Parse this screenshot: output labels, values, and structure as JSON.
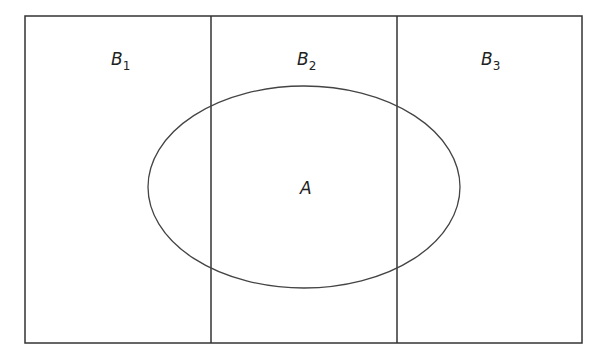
{
  "diagram": {
    "type": "venn-partition",
    "colors": {
      "stroke": "#333333",
      "background": "#ffffff",
      "text": "#222222"
    },
    "partitions": [
      {
        "id": "B1",
        "base": "B",
        "sub": "1"
      },
      {
        "id": "B2",
        "base": "B",
        "sub": "2"
      },
      {
        "id": "B3",
        "base": "B",
        "sub": "3"
      }
    ],
    "event": {
      "id": "A",
      "label": "A"
    }
  }
}
